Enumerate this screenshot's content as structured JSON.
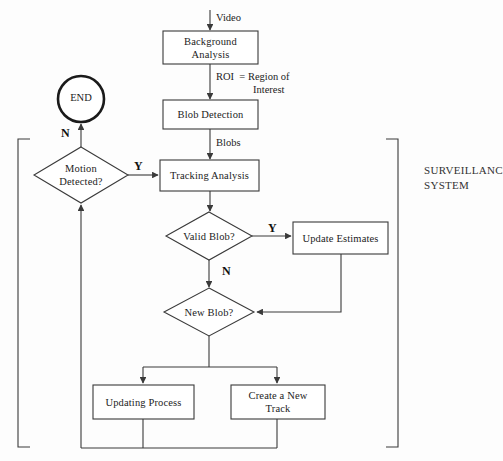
{
  "diagram": {
    "group_label": "SURVEILLANCE\nSYSTEM",
    "stroke_color": "#3a3a3a",
    "text_color": "#1c1c1c",
    "background_color": "#fdfdfd"
  },
  "nodes": {
    "terminator_end": {
      "label": "END",
      "shape": "circle"
    },
    "process_background_analysis": {
      "label": "Background\nAnalysis",
      "line1": "Background",
      "line2": "Analysis",
      "shape": "rectangle"
    },
    "process_blob_detection": {
      "label": "Blob Detection",
      "shape": "rectangle"
    },
    "process_tracking_analysis": {
      "label": "Tracking Analysis",
      "shape": "rectangle"
    },
    "process_update_estimates": {
      "label": "Update Estimates",
      "shape": "rectangle"
    },
    "process_updating_process": {
      "label": "Updating Process",
      "shape": "rectangle"
    },
    "process_create_new_track": {
      "label": "Create a New\nTrack",
      "line1": "Create a New",
      "line2": "Track",
      "shape": "rectangle"
    },
    "decision_motion_detected": {
      "label": "Motion\nDetected?",
      "line1": "Motion",
      "line2": "Detected?",
      "shape": "diamond"
    },
    "decision_valid_blob": {
      "label": "Valid Blob?",
      "shape": "diamond"
    },
    "decision_new_blob": {
      "label": "New Blob?",
      "shape": "diamond"
    }
  },
  "edge_labels": {
    "video": "Video",
    "roi_line1": "ROI  = Region of",
    "roi_line2": "Interest",
    "blobs": "Blobs",
    "motion_yes": "Y",
    "motion_no": "N",
    "valid_blob_yes": "Y",
    "valid_blob_no": "N"
  }
}
